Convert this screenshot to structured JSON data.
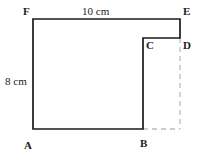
{
  "figure": {
    "type": "geometry-diagram",
    "canvas": {
      "width": 199,
      "height": 162,
      "background": "#ffffff"
    },
    "colors": {
      "outline": "#1a1a1a",
      "dashed": "#bfbfbf",
      "label": "#1a1a1a",
      "background": "#ffffff"
    },
    "vertices": [
      {
        "name": "A",
        "label": "A",
        "x": 33,
        "y": 129
      },
      {
        "name": "B",
        "label": "B",
        "x": 143,
        "y": 129
      },
      {
        "name": "C",
        "label": "C",
        "x": 143,
        "y": 38
      },
      {
        "name": "D",
        "label": "D",
        "x": 180,
        "y": 38
      },
      {
        "name": "E",
        "label": "E",
        "x": 180,
        "y": 19
      },
      {
        "name": "F",
        "label": "F",
        "x": 33,
        "y": 19
      }
    ],
    "outline_path": "M 33 129 L 143 129 L 143 38 L 180 38 L 180 19 L 33 19 Z",
    "dashed_segments": [
      {
        "name": "D-to-corner",
        "x1": 180,
        "y1": 38,
        "x2": 180,
        "y2": 129
      },
      {
        "name": "B-to-corner",
        "x1": 143,
        "y1": 129,
        "x2": 180,
        "y2": 129
      }
    ],
    "dimensions": [
      {
        "name": "top-side-FE",
        "label": "10 cm",
        "value": 10,
        "unit": "cm",
        "side": "FE",
        "position": "top"
      },
      {
        "name": "left-side-AF",
        "label": "8 cm",
        "value": 8,
        "unit": "cm",
        "side": "AF",
        "position": "left"
      }
    ]
  }
}
